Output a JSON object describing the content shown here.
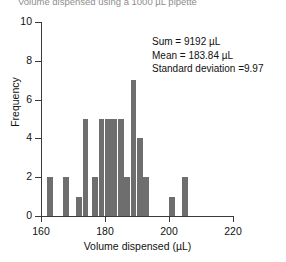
{
  "chart_data": {
    "type": "bar",
    "title": "Volume dispensed using a 1000 µL pipette",
    "xlabel": "Volume dispensed (µL)",
    "ylabel": "Frequency",
    "xlim": [
      160,
      220
    ],
    "ylim": [
      0,
      10
    ],
    "xticks": [
      160,
      180,
      200,
      220
    ],
    "yticks": [
      0,
      2,
      4,
      6,
      8,
      10
    ],
    "grid": false,
    "legend": null,
    "bar_color": "#6e6e6e",
    "bin_width": 2,
    "categories": [
      163,
      168,
      172,
      174,
      177,
      179,
      181,
      183,
      185,
      187,
      189,
      191,
      193,
      201,
      205
    ],
    "values": [
      2,
      2,
      1,
      5,
      2,
      5,
      5,
      5,
      5,
      2,
      7,
      4,
      2,
      1,
      2
    ],
    "annotations": [
      "Sum = 9192 µL",
      "Mean = 183.84 µL",
      "Standard deviation =9.97"
    ]
  },
  "axis": {
    "ytick_labels": [
      "0",
      "2",
      "4",
      "6",
      "8",
      "10"
    ],
    "xtick_labels": [
      "160",
      "180",
      "200",
      "220"
    ]
  }
}
